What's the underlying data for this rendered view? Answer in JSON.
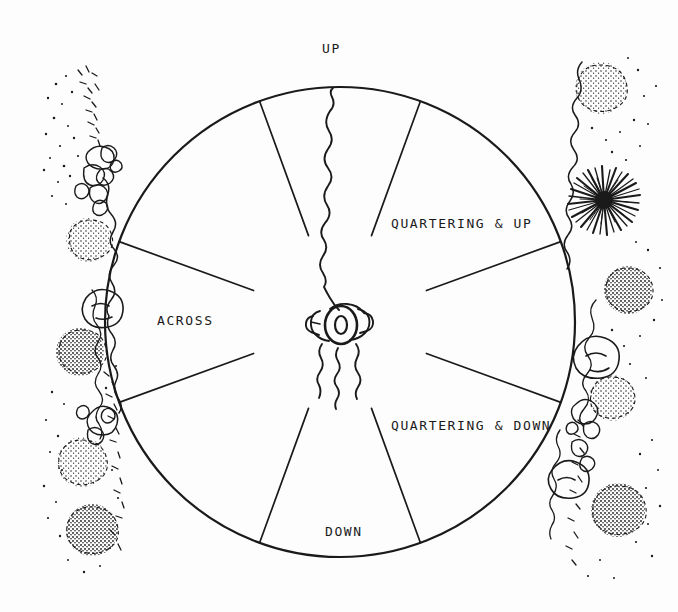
{
  "page": {
    "width": 678,
    "height": 612,
    "background_color": "#fdfdfd",
    "ink_color": "#1a1a1a"
  },
  "diagram": {
    "type": "radial-sector-wheel",
    "center": {
      "x": 340,
      "y": 322
    },
    "radius": 235,
    "inner_gap_radius": 92,
    "stroke_color": "#1a1a1a",
    "circle_stroke_width": 2.2,
    "sector_stroke_width": 1.6,
    "divider_angles_deg": [
      20,
      70,
      110,
      160,
      200,
      250,
      290,
      340
    ],
    "sectors": [
      {
        "name": "up",
        "label": "UP",
        "start_deg": -20,
        "end_deg": 20
      },
      {
        "name": "quartering-up-right",
        "label": "QUARTERING & UP",
        "start_deg": 20,
        "end_deg": 70
      },
      {
        "name": "across-right",
        "label": "",
        "start_deg": 70,
        "end_deg": 110
      },
      {
        "name": "quartering-down-right",
        "label": "QUARTERING & DOWN",
        "start_deg": 110,
        "end_deg": 160
      },
      {
        "name": "down",
        "label": "DOWN",
        "start_deg": 160,
        "end_deg": 200
      },
      {
        "name": "quartering-down-left",
        "label": "",
        "start_deg": 200,
        "end_deg": 250
      },
      {
        "name": "across-left",
        "label": "ACROSS",
        "start_deg": 250,
        "end_deg": 290
      },
      {
        "name": "quartering-up-left",
        "label": "",
        "start_deg": 290,
        "end_deg": 340
      }
    ]
  },
  "labels": [
    {
      "name": "label-up",
      "text": "UP",
      "x": 322,
      "y": 42
    },
    {
      "name": "label-quartering-up",
      "text": "QUARTERING & UP",
      "x": 391,
      "y": 217
    },
    {
      "name": "label-across",
      "text": "ACROSS",
      "x": 157,
      "y": 314
    },
    {
      "name": "label-quartering-down",
      "text": "QUARTERING & DOWN",
      "x": 391,
      "y": 419
    },
    {
      "name": "label-down",
      "text": "DOWN",
      "x": 325,
      "y": 525
    }
  ],
  "center_figure": {
    "name": "cannon-top-view",
    "description": "hand-drawn cannon viewed from above with barrel pointing up",
    "x": 340,
    "y": 325
  },
  "terrain": {
    "left": {
      "name": "terrain-sketch-left",
      "description": "hand-drawn stream with stippled bushes, rocks and scrub",
      "features": [
        "stream-line",
        "rock-cluster",
        "boulder",
        "stipple-bush"
      ]
    },
    "right": {
      "name": "terrain-sketch-right",
      "description": "hand-drawn stream with a dark bushy tree, stippled bushes and rocks",
      "features": [
        "stream-line",
        "dark-bush-tree",
        "stipple-bush",
        "boulder",
        "rock-cluster"
      ]
    }
  }
}
